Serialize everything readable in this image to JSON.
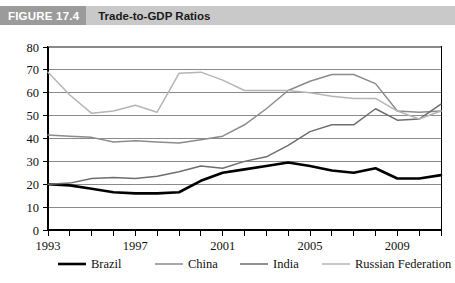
{
  "figure": {
    "tag": "FIGURE 17.4",
    "title": "Trade-to-GDP Ratios"
  },
  "colors": {
    "header_band": "#c9c9c9",
    "tag_block": "#9b9b9b",
    "tag_text": "#ffffff",
    "title_text": "#1a1a1a",
    "brazil": "#000000",
    "china": "#8c8c8c",
    "india": "#6e6e6e",
    "russian_federation": "#b5b5b5",
    "gridline": "#8a8a8a",
    "axis": "#000000"
  },
  "chart_data": {
    "type": "line",
    "title": "Trade-to-GDP Ratios",
    "xlabel": "",
    "ylabel": "",
    "xlim": [
      1993,
      2011
    ],
    "ylim": [
      0,
      80
    ],
    "ytick_step": 10,
    "yticks": [
      "0",
      "10",
      "20",
      "30",
      "40",
      "50",
      "60",
      "70",
      "80"
    ],
    "x": [
      1993,
      1994,
      1995,
      1996,
      1997,
      1998,
      1999,
      2000,
      2001,
      2002,
      2003,
      2004,
      2005,
      2006,
      2007,
      2008,
      2009,
      2010,
      2011
    ],
    "xtick_labels": [
      "1993",
      "1997",
      "2001",
      "2005",
      "2009"
    ],
    "xtick_label_years": [
      1993,
      1997,
      2001,
      2005,
      2009
    ],
    "grid": "horizontal",
    "legend_position": "bottom",
    "series": [
      {
        "name": "Brazil",
        "color": "#000000",
        "width": 2.6,
        "values": [
          20,
          19.5,
          18,
          16.5,
          16,
          16,
          16.5,
          21.5,
          25,
          26.5,
          28,
          29.5,
          28,
          26,
          25,
          27,
          22.5,
          22.5,
          24
        ]
      },
      {
        "name": "China",
        "color": "#8c8c8c",
        "width": 1.5,
        "values": [
          41.5,
          41,
          40.5,
          38.5,
          39,
          38.5,
          38,
          39.5,
          41,
          46,
          53,
          61,
          65,
          68,
          68,
          64,
          52,
          51.5,
          52
        ]
      },
      {
        "name": "India",
        "color": "#6e6e6e",
        "width": 1.5,
        "values": [
          20,
          20.5,
          22.5,
          23,
          22.5,
          23.5,
          25.5,
          28,
          27,
          30,
          32,
          37,
          43,
          46,
          46,
          53,
          48,
          48.5,
          55
        ]
      },
      {
        "name": "Russian Federation",
        "color": "#b5b5b5",
        "width": 1.5,
        "values": [
          69,
          59,
          51,
          52,
          54.5,
          51.5,
          68.5,
          69,
          65.5,
          61,
          61,
          61,
          60,
          58.5,
          57.5,
          57.5,
          52,
          48.5,
          52
        ]
      }
    ],
    "legend": [
      {
        "label": "Brazil",
        "color": "#000000",
        "width": 2.6
      },
      {
        "label": "China",
        "color": "#8c8c8c",
        "width": 1.5
      },
      {
        "label": "India",
        "color": "#6e6e6e",
        "width": 1.5
      },
      {
        "label": "Russian Federation",
        "color": "#b5b5b5",
        "width": 1.5
      }
    ]
  }
}
